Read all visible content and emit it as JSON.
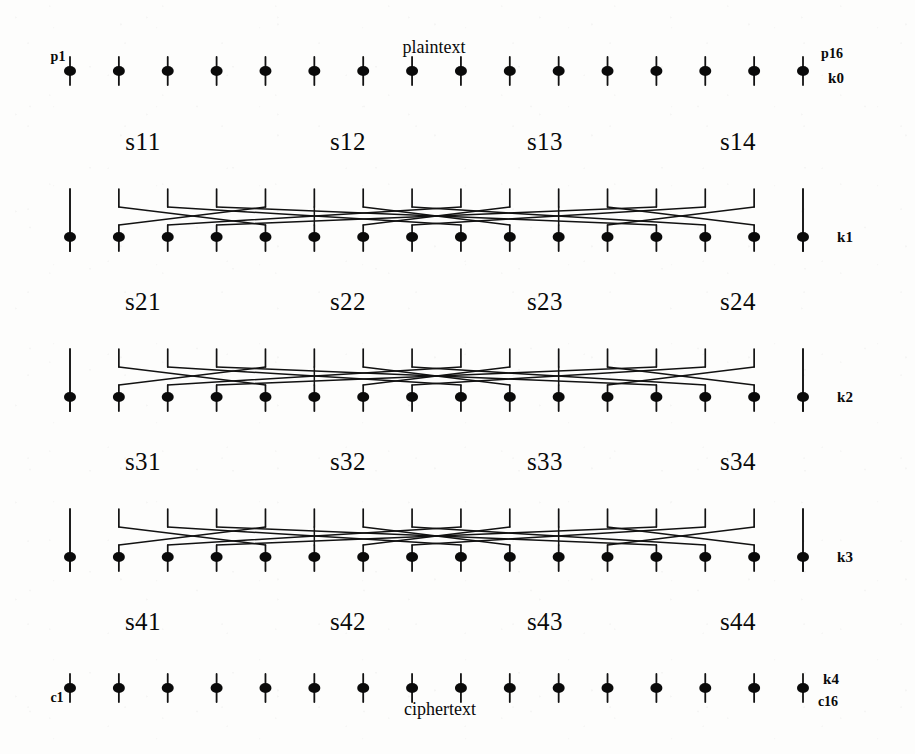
{
  "figure": {
    "title_text": "",
    "type": "substitution-permutation-network",
    "rounds": 4,
    "block_bits": 16,
    "sbox_count_per_round": 4,
    "colors": {
      "ink": "#0a0a0a",
      "paper": "#fdfdfc",
      "wire": "#121212"
    }
  },
  "labels": {
    "plaintext": "plaintext",
    "ciphertext": "ciphertext",
    "first_plain_bit": "p1",
    "last_plain_bit": "p16",
    "first_cipher_bit": "c1",
    "last_cipher_bit": "c16"
  },
  "subkeys": [
    {
      "name": "k0"
    },
    {
      "name": "k1"
    },
    {
      "name": "k2"
    },
    {
      "name": "k3"
    },
    {
      "name": "k4"
    }
  ],
  "sbox_rows": [
    {
      "round": 1,
      "boxes": [
        "s11",
        "s12",
        "s13",
        "s14"
      ]
    },
    {
      "round": 2,
      "boxes": [
        "s21",
        "s22",
        "s23",
        "s24"
      ]
    },
    {
      "round": 3,
      "boxes": [
        "s31",
        "s32",
        "s33",
        "s34"
      ]
    },
    {
      "round": 4,
      "boxes": [
        "s41",
        "s42",
        "s43",
        "s44"
      ]
    }
  ],
  "geometry": {
    "bit_count": 16,
    "x_first": 70,
    "x_last": 803,
    "key_left_x": 70,
    "key_right_x": 803,
    "node_radius_x": 6,
    "node_radius_y": 5,
    "stub_up": 14,
    "stub_down": 14,
    "rows": [
      {
        "id": "plaintext-row",
        "y": 71,
        "kind": "io"
      },
      {
        "id": "permute-row-1",
        "y": 237,
        "kind": "permute"
      },
      {
        "id": "permute-row-2",
        "y": 397,
        "kind": "permute"
      },
      {
        "id": "permute-row-3",
        "y": 557,
        "kind": "permute"
      },
      {
        "id": "ciphertext-row",
        "y": 688,
        "kind": "io"
      }
    ],
    "sbox_label_rows_y": [
      141,
      301,
      461,
      621
    ],
    "sbox_label_x": [
      143,
      348,
      545,
      738
    ],
    "permutation_map": [
      0,
      4,
      8,
      12,
      1,
      5,
      9,
      13,
      2,
      6,
      10,
      14,
      3,
      7,
      11,
      15
    ],
    "top_drop": 48,
    "cross_top_offset": -30,
    "cross_bottom_offset": -12
  },
  "annotations": {
    "plaintext_x": 434,
    "plaintext_y": 47,
    "ciphertext_x": 440,
    "ciphertext_y": 709,
    "p1_x": 58,
    "p1_y": 57,
    "p16_x": 832,
    "p16_y": 54,
    "k0_x": 836,
    "k0_y": 76,
    "c1_x": 57,
    "c1_y": 698,
    "c16_x": 828,
    "c16_y": 702,
    "k4_x": 831,
    "k4_y": 681,
    "key_label_x": 845,
    "key_label_ys": [
      237,
      397,
      557
    ]
  }
}
